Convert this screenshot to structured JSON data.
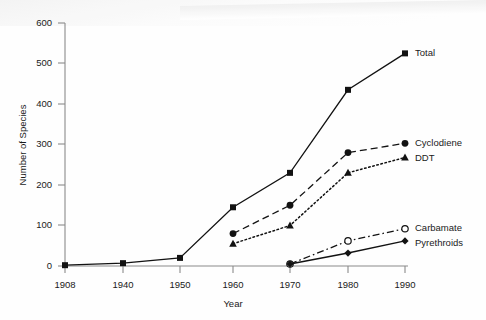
{
  "chart_data": {
    "type": "line",
    "title": "",
    "xlabel": "Year",
    "ylabel": "Number of Species",
    "categories": [
      "1908",
      "1940",
      "1950",
      "1960",
      "1970",
      "1980",
      "1990"
    ],
    "x": [
      1908,
      1940,
      1950,
      1960,
      1970,
      1980,
      1990
    ],
    "xlim": [
      1908,
      1990
    ],
    "ylim": [
      0,
      600
    ],
    "yticks": [
      "0",
      "100",
      "200",
      "300",
      "400",
      "500",
      "600"
    ],
    "ytick_values": [
      0,
      100,
      200,
      300,
      400,
      500,
      600
    ],
    "grid": false,
    "legend_position": "right-inline",
    "series": [
      {
        "name": "Total",
        "marker": "filled-square",
        "line_style": "solid",
        "color": "#121212",
        "x": [
          1908,
          1940,
          1950,
          1960,
          1970,
          1980,
          1990
        ],
        "values": [
          2,
          7,
          20,
          145,
          230,
          435,
          525
        ]
      },
      {
        "name": "Cyclodiene",
        "marker": "filled-circle",
        "line_style": "dashed",
        "color": "#121212",
        "x": [
          1960,
          1970,
          1980,
          1990
        ],
        "values": [
          80,
          150,
          280,
          303
        ]
      },
      {
        "name": "DDT",
        "marker": "filled-triangle",
        "line_style": "dotted",
        "color": "#121212",
        "x": [
          1960,
          1970,
          1980,
          1990
        ],
        "values": [
          55,
          100,
          230,
          268
        ]
      },
      {
        "name": "Carbamate",
        "marker": "open-circle",
        "line_style": "dash-dot",
        "color": "#121212",
        "x": [
          1970,
          1980,
          1990
        ],
        "values": [
          5,
          62,
          92
        ]
      },
      {
        "name": "Pyrethroids",
        "marker": "filled-diamond",
        "line_style": "solid",
        "color": "#121212",
        "x": [
          1970,
          1980,
          1990
        ],
        "values": [
          5,
          32,
          62
        ]
      }
    ]
  },
  "labels": {
    "y_axis_title": "Number of Species",
    "x_axis_title": "Year",
    "y_600": "600",
    "y_500": "500",
    "y_400": "400",
    "y_300": "300",
    "y_200": "200",
    "y_100": "100",
    "y_0": "0",
    "x_1908": "1908",
    "x_1940": "1940",
    "x_1950": "1950",
    "x_1960": "1960",
    "x_1970": "1970",
    "x_1980": "1980",
    "x_1990": "1990",
    "legend_total": "Total",
    "legend_cyclodiene": "Cyclodiene",
    "legend_ddt": "DDT",
    "legend_carbamate": "Carbamate",
    "legend_pyrethroids": "Pyrethroids"
  }
}
